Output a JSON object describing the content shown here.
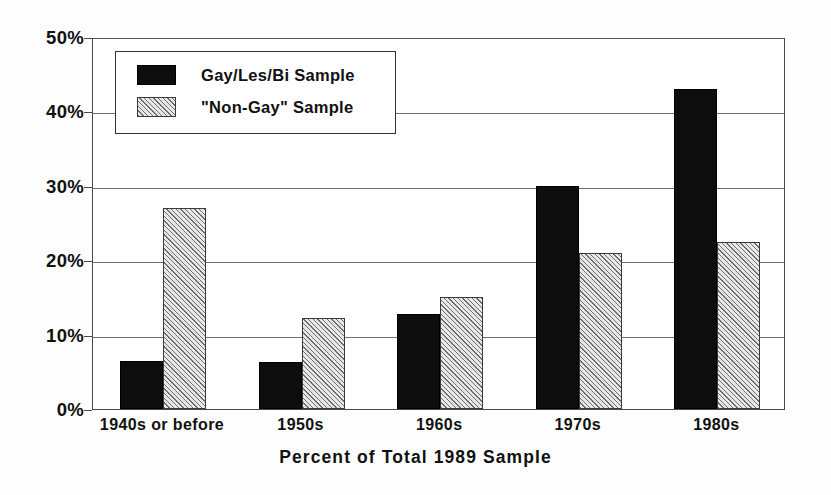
{
  "chart_data": {
    "type": "bar",
    "title": "",
    "subtitle": "",
    "xlabel": "Percent of Total 1989 Sample",
    "ylabel": "",
    "ylim": [
      0,
      50
    ],
    "ytick_values": [
      0,
      10,
      20,
      30,
      40,
      50
    ],
    "ytick_labels": [
      "0%",
      "10%",
      "20%",
      "30%",
      "40%",
      "50%"
    ],
    "grid": true,
    "grid_axis": "y",
    "legend_position": "upper-left-inside",
    "categories": [
      "1940s or before",
      "1950s",
      "1960s",
      "1970s",
      "1980s"
    ],
    "series": [
      {
        "name": "Gay/Les/Bi Sample",
        "style": "solid-black",
        "color": "#0d0d0d",
        "values": [
          6.5,
          6.3,
          12.8,
          30.0,
          43.0
        ]
      },
      {
        "name": "\"Non-Gay\" Sample",
        "style": "diagonal-hatch-gray",
        "color": "#d2d2d2",
        "values": [
          27.0,
          12.3,
          15.0,
          21.0,
          22.4
        ]
      }
    ],
    "units": "percent"
  },
  "legend": {
    "entries": [
      {
        "label": "Gay/Les/Bi Sample",
        "swatch": "solid"
      },
      {
        "label": "\"Non-Gay\" Sample",
        "swatch": "hatch"
      }
    ]
  },
  "axis": {
    "y_labels": [
      "50%",
      "40%",
      "30%",
      "20%",
      "10%",
      "0%"
    ],
    "x_labels": [
      "1940s or before",
      "1950s",
      "1960s",
      "1970s",
      "1980s"
    ],
    "x_title": "Percent of Total 1989 Sample"
  }
}
